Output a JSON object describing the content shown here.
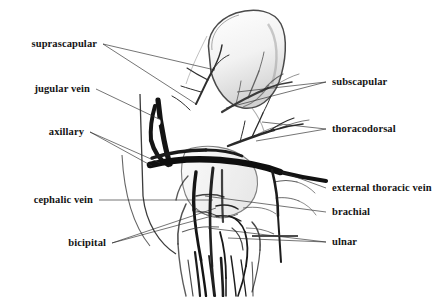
{
  "figure": {
    "width": 446,
    "height": 297,
    "background_color": "#ffffff",
    "ink_color": "#1a1a1a",
    "leader_color": "#2a2a2a",
    "wash_color": "#8a8a8a"
  },
  "labels": {
    "left": [
      {
        "id": "suprascapular",
        "text": "suprascapular",
        "anchor_x": 97,
        "anchor_y": 44,
        "leaders": [
          {
            "x1": 103,
            "y1": 44,
            "x2": 215,
            "y2": 70
          },
          {
            "x1": 103,
            "y1": 44,
            "x2": 196,
            "y2": 104
          }
        ]
      },
      {
        "id": "jugular-vein",
        "text": "jugular vein",
        "anchor_x": 90,
        "anchor_y": 89,
        "leaders": [
          {
            "x1": 96,
            "y1": 89,
            "x2": 161,
            "y2": 120
          }
        ]
      },
      {
        "id": "axillary",
        "text": "axillary",
        "anchor_x": 84,
        "anchor_y": 132,
        "leaders": [
          {
            "x1": 90,
            "y1": 132,
            "x2": 160,
            "y2": 163
          },
          {
            "x1": 90,
            "y1": 132,
            "x2": 152,
            "y2": 166
          }
        ]
      },
      {
        "id": "cephalic-vein",
        "text": "cephalic vein",
        "anchor_x": 93,
        "anchor_y": 200,
        "leaders": [
          {
            "x1": 99,
            "y1": 200,
            "x2": 213,
            "y2": 200
          }
        ]
      },
      {
        "id": "bicipital",
        "text": "bicipital",
        "anchor_x": 106,
        "anchor_y": 243,
        "leaders": [
          {
            "x1": 112,
            "y1": 243,
            "x2": 216,
            "y2": 208
          },
          {
            "x1": 112,
            "y1": 243,
            "x2": 212,
            "y2": 216
          }
        ]
      }
    ],
    "right": [
      {
        "id": "subscapular",
        "text": "subscapular",
        "anchor_x": 332,
        "anchor_y": 82,
        "leaders": [
          {
            "x1": 326,
            "y1": 82,
            "x2": 237,
            "y2": 92
          },
          {
            "x1": 326,
            "y1": 82,
            "x2": 226,
            "y2": 108
          }
        ]
      },
      {
        "id": "thoracodorsal",
        "text": "thoracodorsal",
        "anchor_x": 332,
        "anchor_y": 129,
        "leaders": [
          {
            "x1": 326,
            "y1": 129,
            "x2": 262,
            "y2": 122
          },
          {
            "x1": 326,
            "y1": 129,
            "x2": 256,
            "y2": 141
          }
        ]
      },
      {
        "id": "external-thoracic-vein",
        "text": "external thoracic vein",
        "anchor_x": 332,
        "anchor_y": 188,
        "leaders": [
          {
            "x1": 326,
            "y1": 188,
            "x2": 282,
            "y2": 172
          }
        ]
      },
      {
        "id": "brachial",
        "text": "brachial",
        "anchor_x": 332,
        "anchor_y": 212,
        "leaders": [
          {
            "x1": 326,
            "y1": 212,
            "x2": 205,
            "y2": 196
          }
        ]
      },
      {
        "id": "ulnar",
        "text": "ulnar",
        "anchor_x": 332,
        "anchor_y": 242,
        "leaders": [
          {
            "x1": 326,
            "y1": 242,
            "x2": 208,
            "y2": 228
          },
          {
            "x1": 326,
            "y1": 242,
            "x2": 228,
            "y2": 238
          }
        ]
      }
    ]
  }
}
